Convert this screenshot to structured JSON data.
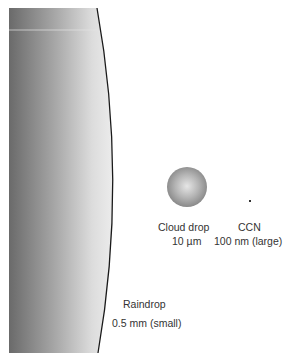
{
  "figure": {
    "raindrop": {
      "label": "Raindrop",
      "size": "0.5 mm (small)"
    },
    "cloud_drop": {
      "label": "Cloud drop",
      "size": "10 µm"
    },
    "ccn": {
      "label": "CCN",
      "size": "100 nm (large)"
    }
  },
  "colors": {
    "gradient_dark": "#6a6a6a",
    "gradient_light": "#ececec",
    "outline": "#1a1a1a",
    "text": "#333333"
  }
}
